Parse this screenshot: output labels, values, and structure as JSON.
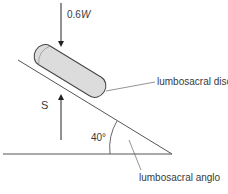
{
  "diagram": {
    "labels": {
      "force_top_prefix": "0.6",
      "force_top_var": "W",
      "force_bottom": "S",
      "angle": "40°",
      "disc": "lumbosacral disc",
      "angle_name": "lumbosacral anglo"
    },
    "colors": {
      "line": "#555555",
      "disc_fill": "#dcdcdc",
      "disc_stroke": "#444444",
      "text": "#3a3a3a"
    }
  }
}
